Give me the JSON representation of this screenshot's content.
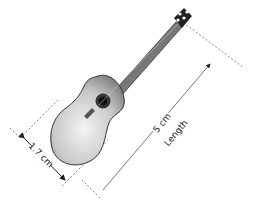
{
  "diagram": {
    "dimensions": [
      {
        "id": "width",
        "value": "1.7 cm"
      },
      {
        "id": "length",
        "value": "5 cm",
        "caption": "Length"
      }
    ]
  }
}
